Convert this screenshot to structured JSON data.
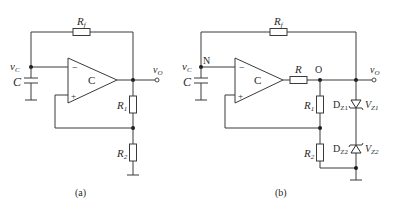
{
  "diagram": {
    "type": "circuit_schematic",
    "circuits": [
      {
        "id": "a",
        "caption": "(a)",
        "opamp_label": "C",
        "components": {
          "feedback_resistor": {
            "main": "R",
            "sub": "f"
          },
          "capacitor": "C",
          "r1": {
            "main": "R",
            "sub": "1"
          },
          "r2": {
            "main": "R",
            "sub": "2"
          }
        },
        "nodes": {
          "cap_voltage": {
            "main": "v",
            "sub": "C"
          },
          "output": {
            "main": "v",
            "sub": "O"
          }
        },
        "inputs": {
          "inverting": "−",
          "noninverting": "+"
        }
      },
      {
        "id": "b",
        "caption": "(b)",
        "opamp_label": "C",
        "components": {
          "feedback_resistor": {
            "main": "R",
            "sub": "f"
          },
          "capacitor": "C",
          "series_resistor": "R",
          "r1": {
            "main": "R",
            "sub": "1"
          },
          "r2": {
            "main": "R",
            "sub": "2"
          },
          "zener1": {
            "name_main": "D",
            "name_sub": "Z1",
            "voltage_main": "V",
            "voltage_sub": "Z1"
          },
          "zener2": {
            "name_main": "D",
            "name_sub": "Z2",
            "voltage_main": "V",
            "voltage_sub": "Z2"
          }
        },
        "nodes": {
          "cap_voltage": {
            "main": "v",
            "sub": "C"
          },
          "node_n": "N",
          "node_o": "O",
          "output": {
            "main": "v",
            "sub": "O"
          }
        },
        "inputs": {
          "inverting": "−",
          "noninverting": "+"
        }
      }
    ]
  }
}
